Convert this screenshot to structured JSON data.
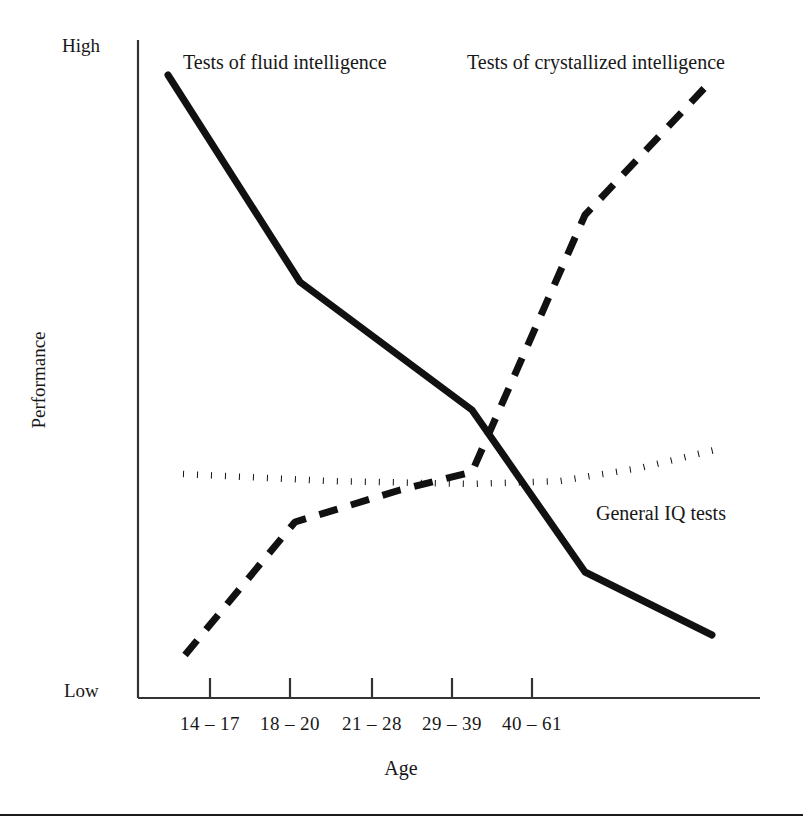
{
  "chart_data": {
    "type": "line",
    "title": "",
    "xlabel": "Age",
    "ylabel": "Performance",
    "categories": [
      "14 – 17",
      "18 – 20",
      "21 – 28",
      "29 – 39",
      "40 – 61"
    ],
    "ytick_labels": [
      "High",
      "Low"
    ],
    "ylim_labels": {
      "top": "High",
      "bottom": "Low"
    },
    "grid": false,
    "legend_position": "inline-annotations",
    "series": [
      {
        "name": "Tests of fluid intelligence",
        "style": "solid",
        "color": "#111111",
        "values": [
          0.95,
          0.63,
          0.44,
          0.19,
          0.1
        ],
        "points": [
          {
            "x": 168,
            "y": 75
          },
          {
            "x": 300,
            "y": 282
          },
          {
            "x": 472,
            "y": 410
          },
          {
            "x": 585,
            "y": 572
          },
          {
            "x": 712,
            "y": 635
          }
        ]
      },
      {
        "name": "Tests of crystallized intelligence",
        "style": "dashed",
        "color": "#111111",
        "values": [
          0.07,
          0.27,
          0.35,
          0.73,
          0.94
        ],
        "points": [
          {
            "x": 185,
            "y": 655
          },
          {
            "x": 295,
            "y": 522
          },
          {
            "x": 400,
            "y": 490
          },
          {
            "x": 472,
            "y": 472
          },
          {
            "x": 585,
            "y": 215
          },
          {
            "x": 712,
            "y": 80
          }
        ]
      },
      {
        "name": "General IQ tests",
        "style": "dotted",
        "color": "#111111",
        "values": [
          0.34,
          0.33,
          0.33,
          0.34,
          0.38
        ],
        "points": [
          {
            "x": 183,
            "y": 474
          },
          {
            "x": 330,
            "y": 481
          },
          {
            "x": 472,
            "y": 484
          },
          {
            "x": 560,
            "y": 481
          },
          {
            "x": 640,
            "y": 468
          },
          {
            "x": 723,
            "y": 448
          }
        ]
      }
    ],
    "annotations": [
      {
        "text": "Tests of fluid intelligence",
        "x": 183,
        "y": 64
      },
      {
        "text": "Tests of crystallized intelligence",
        "x": 467,
        "y": 64
      },
      {
        "text": "General IQ tests",
        "x": 596,
        "y": 515
      }
    ],
    "axes": {
      "y_axis_x": 138,
      "y_axis_top": 40,
      "y_axis_bottom": 698,
      "x_axis_y": 698,
      "x_axis_left": 138,
      "x_axis_right": 760,
      "tick_x_positions": [
        210,
        290,
        372,
        452,
        532
      ]
    }
  },
  "figure": {
    "axis_label_high": "High",
    "axis_label_low": "Low",
    "axis_title_y": "Performance",
    "axis_title_x": "Age",
    "tick_labels": [
      "14 – 17",
      "18 – 20",
      "21 – 28",
      "29 – 39",
      "40 – 61"
    ],
    "series_label_fluid": "Tests of fluid intelligence",
    "series_label_crystallized": "Tests of crystallized intelligence",
    "series_label_generaliq": "General IQ tests",
    "ink_color": "#111111"
  }
}
